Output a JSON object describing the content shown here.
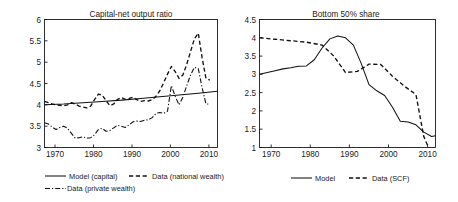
{
  "figure": {
    "width": 458,
    "height": 202,
    "background": "#ffffff",
    "line_color": "#111111"
  },
  "chart_data": [
    {
      "panel": "left",
      "type": "line",
      "title": "Capital-net output ratio",
      "xlabel": "",
      "ylabel": "",
      "xlim": [
        1967,
        2012
      ],
      "ylim": [
        3,
        6
      ],
      "xticks": [
        1970,
        1980,
        1990,
        2000,
        2010
      ],
      "yticks": [
        3,
        3.5,
        4,
        4.5,
        5,
        5.5,
        6
      ],
      "xticklabels": [
        "1970",
        "1980",
        "1990",
        "2000",
        "2010"
      ],
      "yticklabels": [
        "3",
        "3.5",
        "4",
        "4.5",
        "5",
        "5.5",
        "6"
      ],
      "grid": false,
      "legend_position": "below",
      "series": [
        {
          "name": "Model (capital)",
          "style": "solid",
          "x": [
            1967,
            1972,
            1977,
            1982,
            1987,
            1992,
            1997,
            2002,
            2007,
            2012
          ],
          "values": [
            4.0,
            4.02,
            4.05,
            4.08,
            4.11,
            4.15,
            4.19,
            4.23,
            4.27,
            4.32
          ]
        },
        {
          "name": "Data (national wealth)",
          "style": "dashed",
          "x": [
            1967,
            1968,
            1969,
            1970,
            1971,
            1972,
            1973,
            1974,
            1975,
            1976,
            1977,
            1978,
            1979,
            1980,
            1981,
            1982,
            1983,
            1984,
            1985,
            1986,
            1987,
            1988,
            1989,
            1990,
            1991,
            1992,
            1993,
            1994,
            1995,
            1996,
            1997,
            1998,
            1999,
            2000,
            2001,
            2002,
            2003,
            2004,
            2005,
            2006,
            2007,
            2008,
            2009,
            2010
          ],
          "values": [
            4.08,
            4.05,
            4.02,
            4.0,
            3.99,
            3.98,
            4.0,
            4.05,
            4.02,
            3.97,
            3.95,
            3.93,
            3.97,
            4.12,
            4.25,
            4.23,
            4.1,
            3.98,
            4.02,
            4.13,
            4.17,
            4.13,
            4.15,
            4.18,
            4.12,
            4.08,
            4.1,
            4.09,
            4.12,
            4.2,
            4.33,
            4.52,
            4.72,
            4.9,
            4.78,
            4.62,
            4.7,
            4.95,
            5.25,
            5.55,
            5.68,
            5.1,
            4.62,
            4.58
          ]
        },
        {
          "name": "Data (private wealth)",
          "style": "dashdot",
          "x": [
            1967,
            1968,
            1969,
            1970,
            1971,
            1972,
            1973,
            1974,
            1975,
            1976,
            1977,
            1978,
            1979,
            1980,
            1981,
            1982,
            1983,
            1984,
            1985,
            1986,
            1987,
            1988,
            1989,
            1990,
            1991,
            1992,
            1993,
            1994,
            1995,
            1996,
            1997,
            1998,
            1999,
            2000,
            2001,
            2002,
            2003,
            2004,
            2005,
            2006,
            2007,
            2008,
            2009,
            2010
          ],
          "values": [
            3.58,
            3.55,
            3.48,
            3.42,
            3.47,
            3.5,
            3.45,
            3.33,
            3.22,
            3.23,
            3.25,
            3.22,
            3.23,
            3.3,
            3.42,
            3.45,
            3.38,
            3.4,
            3.46,
            3.52,
            3.5,
            3.47,
            3.53,
            3.6,
            3.62,
            3.61,
            3.64,
            3.65,
            3.7,
            3.8,
            3.82,
            3.8,
            3.85,
            4.45,
            4.2,
            4.0,
            4.18,
            4.45,
            4.7,
            4.88,
            4.85,
            4.4,
            4.02,
            4.02
          ]
        }
      ]
    },
    {
      "panel": "right",
      "type": "line",
      "title": "Bottom 50% share",
      "xlabel": "",
      "ylabel": "",
      "xlim": [
        1967,
        2012
      ],
      "ylim": [
        1,
        4.5
      ],
      "xticks": [
        1970,
        1980,
        1990,
        2000,
        2010
      ],
      "yticks": [
        1,
        1.5,
        2,
        2.5,
        3,
        3.5,
        4,
        4.5
      ],
      "xticklabels": [
        "1970",
        "1980",
        "1990",
        "2000",
        "2010"
      ],
      "yticklabels": [
        "1",
        "1.5",
        "2",
        "2.5",
        "3",
        "3.5",
        "4",
        "4.5"
      ],
      "grid": false,
      "legend_position": "below",
      "series": [
        {
          "name": "Model",
          "style": "solid",
          "x": [
            1967,
            1969,
            1971,
            1973,
            1975,
            1977,
            1979,
            1981,
            1983,
            1985,
            1987,
            1989,
            1991,
            1993,
            1995,
            1997,
            1999,
            2001,
            2003,
            2005,
            2007,
            2009,
            2011,
            2012
          ],
          "values": [
            3.0,
            3.05,
            3.1,
            3.15,
            3.18,
            3.22,
            3.23,
            3.4,
            3.72,
            3.97,
            4.05,
            4.0,
            3.8,
            3.3,
            2.72,
            2.55,
            2.42,
            2.1,
            1.72,
            1.7,
            1.62,
            1.42,
            1.3,
            1.32
          ]
        },
        {
          "name": "Data (SCF)",
          "style": "dashed",
          "x": [
            1967,
            1971,
            1975,
            1979,
            1983,
            1986,
            1989,
            1992,
            1995,
            1998,
            2001,
            2004,
            2007,
            2009,
            2010
          ],
          "values": [
            4.0,
            3.96,
            3.92,
            3.88,
            3.8,
            3.5,
            3.05,
            3.08,
            3.28,
            3.27,
            2.95,
            2.68,
            2.45,
            1.3,
            1.05
          ]
        }
      ]
    }
  ],
  "legends": {
    "left": [
      {
        "label": "Model (capital)",
        "style": "solid"
      },
      {
        "label": "Data (national wealth)",
        "style": "dashed"
      },
      {
        "label": "Data (private wealth)",
        "style": "dashdot"
      }
    ],
    "right": [
      {
        "label": "Model",
        "style": "solid"
      },
      {
        "label": "Data (SCF)",
        "style": "dashed"
      }
    ]
  }
}
